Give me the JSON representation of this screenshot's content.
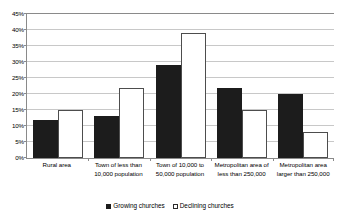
{
  "chart_data": {
    "type": "bar",
    "title": "",
    "subtitle": "",
    "xlabel": "",
    "ylabel": "",
    "ylim": [
      0,
      45
    ],
    "ytick_step": 5,
    "ytick_labels": [
      "0%",
      "5%",
      "10%",
      "15%",
      "20%",
      "25%",
      "30%",
      "35%",
      "40%",
      "45%"
    ],
    "ytick_values": [
      0,
      5,
      10,
      15,
      20,
      25,
      30,
      35,
      40,
      45
    ],
    "grid": true,
    "legend_position": "bottom",
    "categories": [
      "Rural area",
      "Town of less than\n10,000 population",
      "Town of 10,000 to\n50,000 population",
      "Metropolitan area of\nless than 250,000",
      "Metropolitan area\nlarger than 250,000"
    ],
    "series": [
      {
        "name": "Growing churches",
        "color": "#1c1c1c",
        "values": [
          12,
          13,
          29,
          22,
          20
        ]
      },
      {
        "name": "Declining churches",
        "color": "#ffffff",
        "values": [
          15,
          22,
          39,
          15,
          8
        ]
      }
    ]
  },
  "legend": {
    "items": [
      {
        "label": "Growing churches",
        "style": "growing"
      },
      {
        "label": "Declining churches",
        "style": "declining"
      }
    ]
  },
  "colors": {
    "growing": "#1c1c1c",
    "declining": "#ffffff",
    "axis": "#8a8a8a",
    "grid": "#c8c8c8",
    "background": "#ffffff"
  }
}
